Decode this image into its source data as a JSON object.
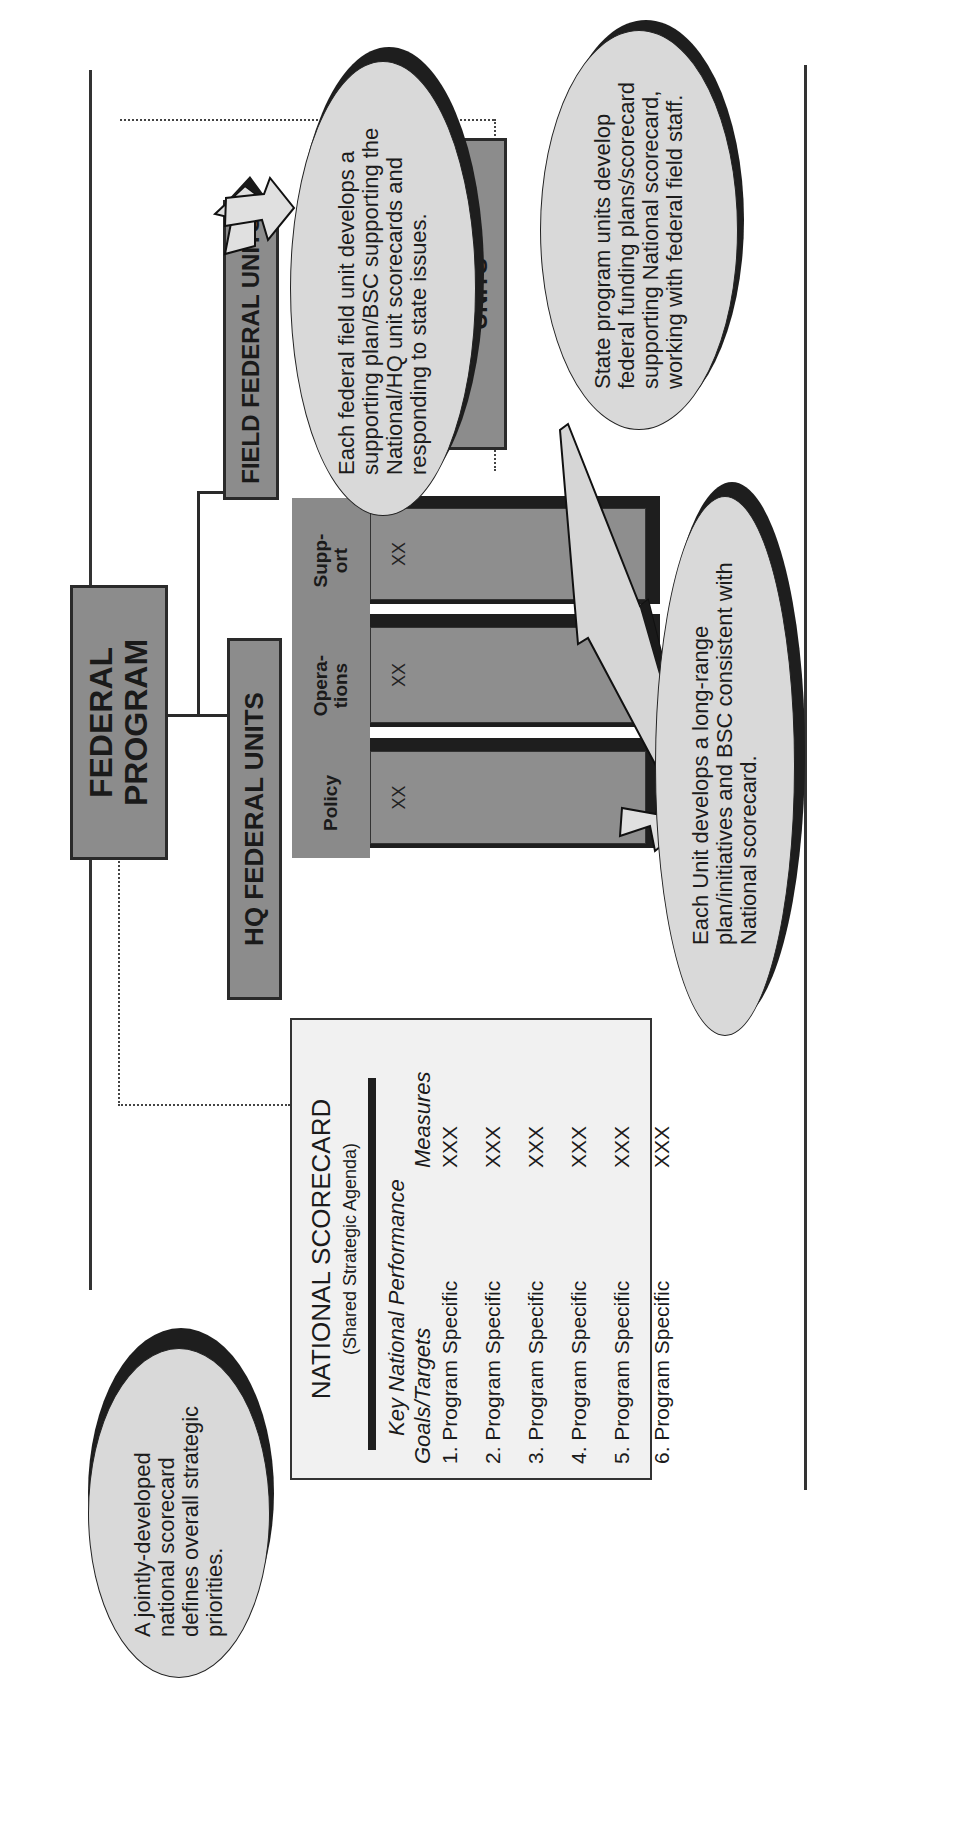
{
  "diagram": {
    "federal_program": {
      "line1": "FEDERAL",
      "line2": "PROGRAM"
    },
    "hq_federal_units": {
      "label": "HQ FEDERAL UNITS"
    },
    "field_federal_units": {
      "label": "FIELD FEDERAL UNITS"
    },
    "state_program_units": {
      "line1": "STATE PROGRAM",
      "line2": "UNITS"
    },
    "hq_columns": [
      {
        "header_line1": "Policy",
        "header_line2": "",
        "value": "XX"
      },
      {
        "header_line1": "Opera-",
        "header_line2": "tions",
        "value": "XX"
      },
      {
        "header_line1": "Supp-",
        "header_line2": "ort",
        "value": "XX"
      }
    ],
    "national_scorecard": {
      "title": "NATIONAL SCORECARD",
      "subtitle": "(Shared Strategic Agenda)",
      "header_left_line1": "Key National Performance",
      "header_left_line2": "Goals/Targets",
      "header_right": "Measures",
      "rows": [
        {
          "goal": "1. Program Specific",
          "measure": "XXX"
        },
        {
          "goal": "2. Program Specific",
          "measure": "XXX"
        },
        {
          "goal": "3. Program Specific",
          "measure": "XXX"
        },
        {
          "goal": "4. Program Specific",
          "measure": "XXX"
        },
        {
          "goal": "5. Program Specific",
          "measure": "XXX"
        },
        {
          "goal": "6. Program Specific",
          "measure": "XXX"
        }
      ]
    },
    "callouts": {
      "national": "A jointly-developed national scorecard defines overall strategic priorities.",
      "field": "Each federal field unit develops a supporting plan/BSC supporting the National/HQ unit scorecards and responding to state issues.",
      "state": "State program units develop federal funding plans/scorecard supporting National scorecard, working with federal field staff.",
      "unit": "Each Unit develops a long-range plan/initiatives and BSC consistent with National scorecard."
    }
  }
}
